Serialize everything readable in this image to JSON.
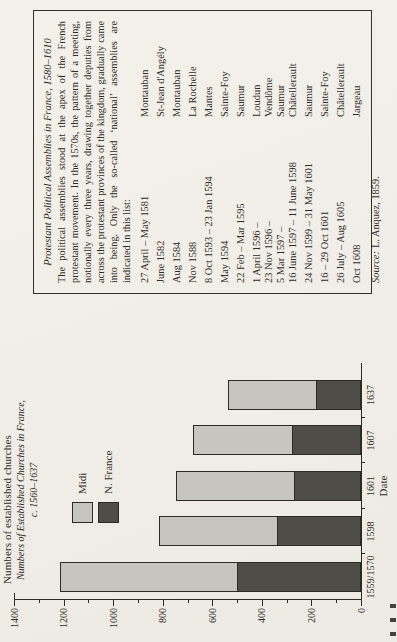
{
  "colors": {
    "paper": "#f2efe9",
    "ink": "#2e2b25",
    "box_border": "#34312b",
    "bar_light": "#c6c5c0",
    "bar_dark": "#4f4d48"
  },
  "assemblies_box": {
    "title": "Protestant Political Assemblies in France, 1580–1610",
    "intro": "The political assemblies stood at the apex of the French protestant movement. In the 1570s, the pattern of a meeting, notionally every three years, drawing together deputies from across the protestant provinces of the kingdom, gradually came into being. Only the so-called ‘national’ assemblies are indicated in this list:",
    "entries": [
      {
        "date": "27 April – May 1581",
        "place": "Montauban",
        "tight": false
      },
      {
        "date": "June 1582",
        "place": "St-Jean d'Angély",
        "tight": false
      },
      {
        "date": "Aug 1584",
        "place": "Montauban",
        "tight": false
      },
      {
        "date": "Nov 1588",
        "place": "La Rochelle",
        "tight": false
      },
      {
        "date": "8 Oct 1593 – 23 Jan 1594",
        "place": "Mantes",
        "tight": false
      },
      {
        "date": "May 1594",
        "place": "Sainte-Foy",
        "tight": false
      },
      {
        "date": "22 Feb – Mar 1595",
        "place": "Saumur",
        "tight": false
      },
      {
        "date": "1 April 1596 –",
        "place": "Loudun",
        "tight": false
      },
      {
        "date": "23 Nov 1596 –",
        "place": "Vendôme",
        "tight": true
      },
      {
        "date": "5 Mar 1597 –",
        "place": "Saumur",
        "tight": true
      },
      {
        "date": "16 June 1597 – 11 June 1598",
        "place": "Châtellerault",
        "tight": true
      },
      {
        "date": "24 Nov 1599 – 31 May 1601",
        "place": "Saumur",
        "tight": false
      },
      {
        "date": "16 – 29 Oct 1601",
        "place": "Sainte-Foy",
        "tight": false
      },
      {
        "date": "26 July – Aug 1605",
        "place": "Châtellerault",
        "tight": false
      },
      {
        "date": "Oct 1608",
        "place": "Jargeau",
        "tight": false
      }
    ],
    "source_label": "Source:",
    "source_text": "L. Anquez, 1859."
  },
  "chart_data": {
    "type": "bar",
    "stacked": true,
    "title": "Numbers of Established Churches in France, c. 1560–1637",
    "title_line1": "Numbers of Established Churches in France,",
    "title_line2": "c. 1560–1637",
    "axis_label": "Numbers of established churches",
    "xlabel": "Date",
    "categories": [
      "1559/1570",
      "1598",
      "1601",
      "1607",
      "1637"
    ],
    "series": [
      {
        "name": "Midi",
        "color": "#c6c5c0",
        "values": [
          720,
          480,
          480,
          400,
          360
        ]
      },
      {
        "name": "N. France",
        "color": "#4f4d48",
        "values": [
          500,
          340,
          270,
          280,
          180
        ]
      }
    ],
    "totals": [
      1220,
      820,
      750,
      680,
      540
    ],
    "ylim": [
      0,
      1400
    ],
    "ytick_step": 200,
    "ytick_minor_step": 100,
    "yticks": [
      0,
      200,
      400,
      600,
      800,
      1000,
      1200,
      1400
    ],
    "legend_position": "upper-left",
    "grid": false,
    "orientation_note": "figure rotated 90deg CCW on page"
  }
}
